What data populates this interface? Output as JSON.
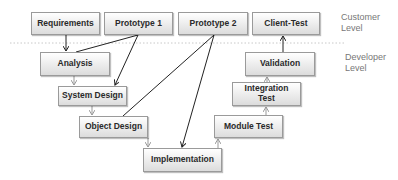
{
  "diagram": {
    "levels": {
      "customer": {
        "line1": "Customer",
        "line2": "Level"
      },
      "developer": {
        "line1": "Developer",
        "line2": "Level"
      }
    },
    "nodes": {
      "requirements": "Requirements",
      "prototype1": "Prototype 1",
      "prototype2": "Prototype 2",
      "client_test": "Client-Test",
      "analysis": "Analysis",
      "system_design": "System Design",
      "object_design": "Object Design",
      "implementation": "Implementation",
      "module_test": "Module Test",
      "integration_test": {
        "line1": "Integration",
        "line2": "Test"
      },
      "validation": "Validation"
    },
    "edges": [
      {
        "from": "Requirements",
        "to": "Analysis",
        "style": "solid"
      },
      {
        "from": "Prototype 1",
        "to": "Analysis",
        "style": "solid-line"
      },
      {
        "from": "Prototype 1",
        "to": "System Design",
        "style": "solid"
      },
      {
        "from": "Prototype 2",
        "to": "Object Design",
        "style": "solid-line"
      },
      {
        "from": "Prototype 2",
        "to": "Implementation",
        "style": "solid"
      },
      {
        "from": "Analysis",
        "to": "System Design",
        "style": "light"
      },
      {
        "from": "System Design",
        "to": "Object Design",
        "style": "light"
      },
      {
        "from": "Object Design",
        "to": "Implementation",
        "style": "light"
      },
      {
        "from": "Implementation",
        "to": "Module Test",
        "style": "light"
      },
      {
        "from": "Module Test",
        "to": "Integration Test",
        "style": "light"
      },
      {
        "from": "Integration Test",
        "to": "Validation",
        "style": "light"
      },
      {
        "from": "Validation",
        "to": "Client-Test",
        "style": "solid"
      }
    ],
    "colors": {
      "box_border": "#9a9a9a",
      "box_top": "#ffffff",
      "box_bottom": "#dcdcdc",
      "text": "#2a2a2a",
      "level_text": "#777777",
      "separator": "#c8c8c8"
    }
  }
}
